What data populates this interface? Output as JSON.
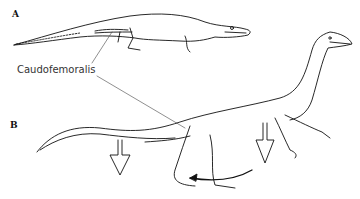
{
  "figure": {
    "panels": [
      {
        "label": "A",
        "subject": "crocodile"
      },
      {
        "label": "B",
        "subject": "theropod dinosaur"
      }
    ],
    "callout": "Caudofemoralis",
    "annotations": {
      "arrows_down": 2,
      "curved_arrow": "leg retraction"
    },
    "colors": {
      "line": "#111111",
      "background": "#ffffff"
    }
  }
}
